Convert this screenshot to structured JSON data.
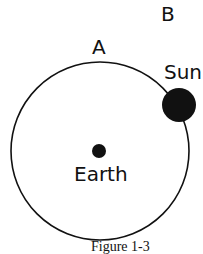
{
  "diagram": {
    "labels": {
      "a": "A",
      "b": "B",
      "sun": "Sun",
      "earth": "Earth"
    },
    "caption": "Figure 1-3",
    "colors": {
      "line": "#111111",
      "fill": "#111111",
      "background": "#ffffff"
    }
  }
}
